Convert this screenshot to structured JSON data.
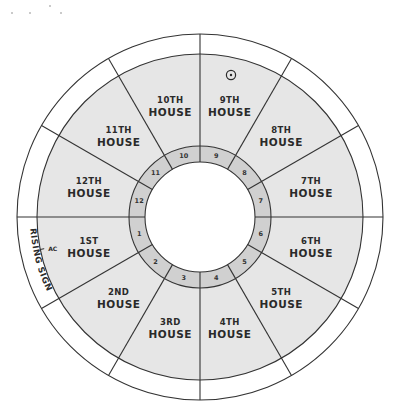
{
  "diagram": {
    "colors": {
      "background": "#ffffff",
      "outer_band": "#ffffff",
      "house_fill": "#e6e6e6",
      "ring_fill": "#d0d0d0",
      "center_fill": "#ffffff",
      "stroke": "#333333",
      "text": "#2a2a2a"
    },
    "geometry": {
      "cx": 200,
      "cy": 217,
      "r_outer": 183,
      "r_houses": 163,
      "r_ring_outer": 71,
      "r_ring_inner": 55
    },
    "houses": [
      {
        "num": "1",
        "ordinal": "1ST",
        "word": "HOUSE",
        "ring_label": "1"
      },
      {
        "num": "2",
        "ordinal": "2ND",
        "word": "HOUSE",
        "ring_label": "2"
      },
      {
        "num": "3",
        "ordinal": "3RD",
        "word": "HOUSE",
        "ring_label": "3"
      },
      {
        "num": "4",
        "ordinal": "4TH",
        "word": "HOUSE",
        "ring_label": "4"
      },
      {
        "num": "5",
        "ordinal": "5TH",
        "word": "HOUSE",
        "ring_label": "5"
      },
      {
        "num": "6",
        "ordinal": "6TH",
        "word": "HOUSE",
        "ring_label": "6"
      },
      {
        "num": "7",
        "ordinal": "7TH",
        "word": "HOUSE",
        "ring_label": "7"
      },
      {
        "num": "8",
        "ordinal": "8TH",
        "word": "HOUSE",
        "ring_label": "8"
      },
      {
        "num": "9",
        "ordinal": "9TH",
        "word": "HOUSE",
        "ring_label": "9"
      },
      {
        "num": "10",
        "ordinal": "10TH",
        "word": "HOUSE",
        "ring_label": "10"
      },
      {
        "num": "11",
        "ordinal": "11TH",
        "word": "HOUSE",
        "ring_label": "11"
      },
      {
        "num": "12",
        "ordinal": "12TH",
        "word": "HOUSE",
        "ring_label": "12"
      }
    ],
    "rising_sign_label": "RISING SIGN",
    "ascendant_label": "AC",
    "sun_symbol": "sun-icon",
    "sun_house": "9"
  }
}
